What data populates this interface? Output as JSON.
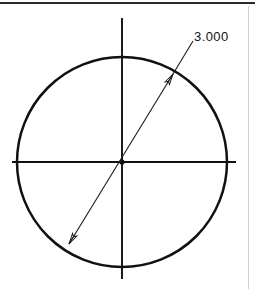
{
  "drawing": {
    "title": "Circle diameter dimension",
    "type": "cad-2d-sketch",
    "background_color": "#ffffff",
    "line_color": "#111111",
    "dimension_color": "#1a1a1a",
    "units": "inches"
  },
  "borders": {
    "top_rule_label": "top border rule",
    "right_rule_label": "right border rule"
  },
  "circle": {
    "label": "circle-profile",
    "center_x": 122,
    "center_y": 162,
    "radius": 105,
    "stroke_width": 2.4
  },
  "centerlines": {
    "horizontal": {
      "label": "horizontal centerline",
      "x1": 12,
      "y1": 162,
      "x2": 236,
      "y2": 162
    },
    "vertical": {
      "label": "vertical centerline",
      "x1": 122,
      "y1": 18,
      "x2": 122,
      "y2": 279
    },
    "center_mark": {
      "label": "center point",
      "x": 122,
      "y": 162,
      "radius": 2.6
    }
  },
  "dimension": {
    "name": "diameter-dimension",
    "value_text": "3.000",
    "kind": "diameter",
    "line": {
      "start_x": 69,
      "start_y": 244,
      "end_x": 173,
      "end_y": 74
    },
    "leader": {
      "from_x": 173,
      "from_y": 74,
      "to_x": 193,
      "to_y": 41
    },
    "text_position": {
      "x": 194,
      "y": 40
    },
    "arrow_start": {
      "label": "lower-left arrowhead",
      "tip_x": 69,
      "tip_y": 244
    },
    "arrow_end": {
      "label": "upper-right arrowhead",
      "tip_x": 173,
      "tip_y": 74
    }
  }
}
